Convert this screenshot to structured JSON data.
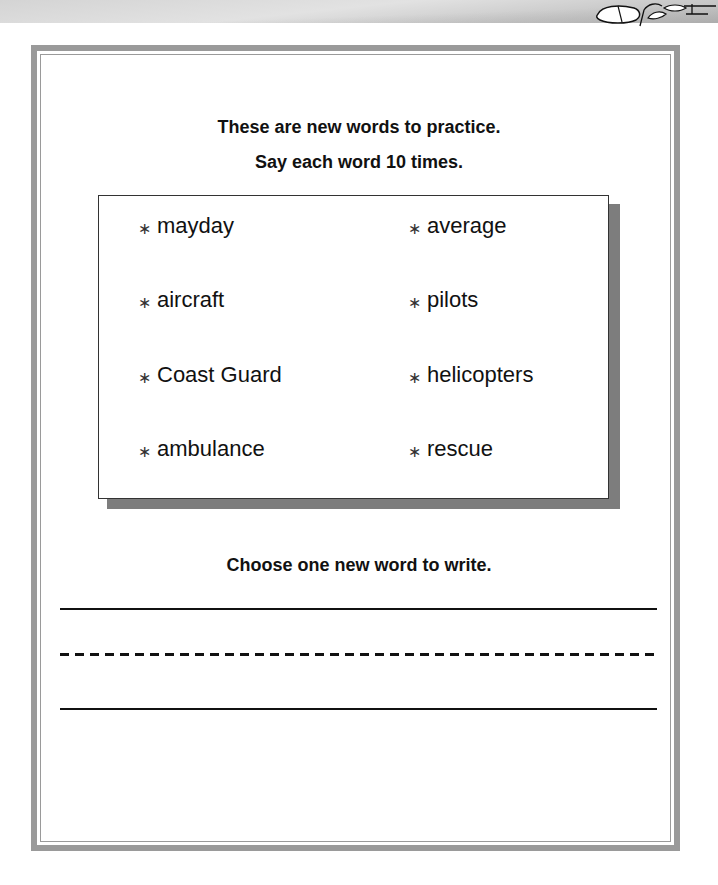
{
  "banner": {
    "icon": "clipart-decoration-icon"
  },
  "header": {
    "line1": "These are new words to practice.",
    "line2": "Say each word 10 times."
  },
  "word_box": {
    "bullet": "∗",
    "words": [
      {
        "label": "mayday"
      },
      {
        "label": "average"
      },
      {
        "label": "aircraft"
      },
      {
        "label": "pilots"
      },
      {
        "label": "Coast Guard"
      },
      {
        "label": "helicopters"
      },
      {
        "label": "ambulance"
      },
      {
        "label": "rescue"
      }
    ]
  },
  "writing": {
    "prompt": "Choose one new word to write."
  },
  "colors": {
    "frame": "#9a9a9a",
    "shadow": "#7d7d7d",
    "text": "#111111"
  }
}
